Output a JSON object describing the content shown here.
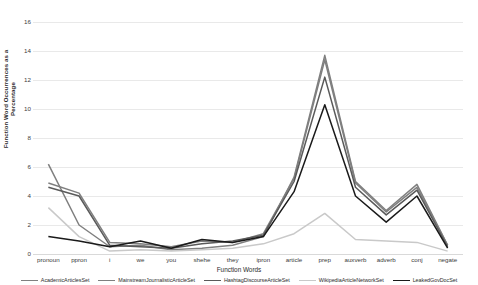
{
  "chart_data": {
    "type": "line",
    "title": "",
    "xlabel": "Function Words",
    "ylabel": "Function Word Occurrences as a Percentage",
    "ylim": [
      0,
      16
    ],
    "yticks": [
      0,
      2,
      4,
      6,
      8,
      10,
      12,
      14,
      16
    ],
    "grid": true,
    "legend_position": "bottom",
    "categories": [
      "pronoun",
      "ppron",
      "i",
      "we",
      "you",
      "shehe",
      "they",
      "ipron",
      "article",
      "prep",
      "auxverb",
      "adverb",
      "conj",
      "negate"
    ],
    "series": [
      {
        "name": "AcademicArticlesSet",
        "color": "#808080",
        "values": [
          6.2,
          2.0,
          0.5,
          0.6,
          0.3,
          0.4,
          0.6,
          1.2,
          5.3,
          13.7,
          5.0,
          3.0,
          4.8,
          0.6
        ]
      },
      {
        "name": "MainstreamJournalisticArticleSet",
        "color": "#7f7f7f",
        "values": [
          4.9,
          4.2,
          0.8,
          0.7,
          0.5,
          0.9,
          0.8,
          1.4,
          5.2,
          13.4,
          4.9,
          2.9,
          4.6,
          0.6
        ]
      },
      {
        "name": "HashtagDiscourseArticleSet",
        "color": "#5a5a5a",
        "values": [
          4.6,
          4.0,
          0.6,
          0.5,
          0.4,
          0.7,
          0.9,
          1.3,
          5.0,
          12.2,
          4.6,
          2.7,
          4.4,
          0.5
        ]
      },
      {
        "name": "WikipediaArticleNetworkSet",
        "color": "#c9c9c9",
        "values": [
          3.2,
          1.2,
          0.2,
          0.3,
          0.2,
          0.3,
          0.4,
          0.7,
          1.4,
          2.8,
          1.0,
          0.9,
          0.8,
          0.2
        ]
      },
      {
        "name": "LeakedGovDocSet",
        "color": "#1a1a1a",
        "values": [
          1.2,
          0.9,
          0.5,
          0.9,
          0.4,
          1.0,
          0.8,
          1.2,
          4.3,
          10.3,
          4.0,
          2.2,
          4.0,
          0.4
        ]
      }
    ]
  }
}
